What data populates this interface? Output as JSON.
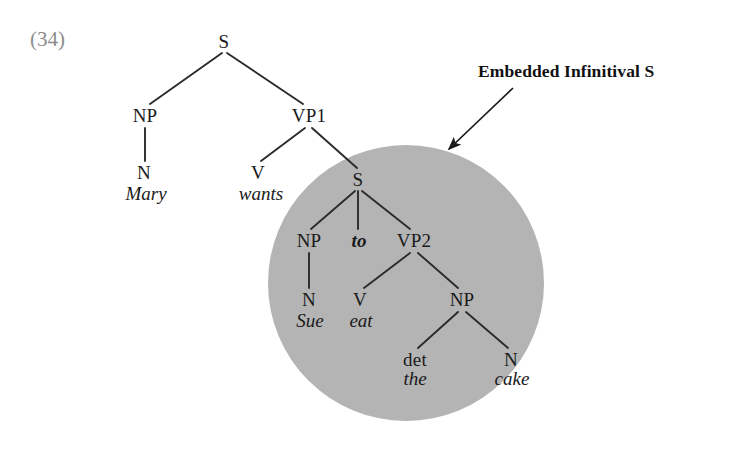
{
  "example": {
    "number_label": "(34)"
  },
  "annotation": {
    "callout_text": "Embedded Infinitival S",
    "arrow_name": "callout-arrow",
    "highlight_shape": "circle",
    "highlight_color": "#b4b4b4"
  },
  "colors": {
    "background": "#ffffff",
    "ink": "#1a1a1a",
    "example_number": "#8c8c8c",
    "highlight_gray": "#b4b4b4",
    "edge_line": "#2b2b2b"
  },
  "tree": {
    "nodes": [
      {
        "id": "S0",
        "label": "S",
        "x": 224,
        "y": 41,
        "kind": "category"
      },
      {
        "id": "NP1",
        "label": "NP",
        "x": 145,
        "y": 115,
        "kind": "category"
      },
      {
        "id": "VP1",
        "label": "VP1",
        "x": 309,
        "y": 115,
        "kind": "category"
      },
      {
        "id": "N1",
        "label": "N",
        "x": 144,
        "y": 172,
        "kind": "category"
      },
      {
        "id": "V1",
        "label": "V",
        "x": 258,
        "y": 172,
        "kind": "category"
      },
      {
        "id": "S1",
        "label": "S",
        "x": 358,
        "y": 179,
        "kind": "category"
      },
      {
        "id": "NP2",
        "label": "NP",
        "x": 309,
        "y": 240,
        "kind": "category"
      },
      {
        "id": "VP2",
        "label": "VP2",
        "x": 414,
        "y": 240,
        "kind": "category"
      },
      {
        "id": "N2",
        "label": "N",
        "x": 309,
        "y": 299,
        "kind": "category"
      },
      {
        "id": "V2",
        "label": "V",
        "x": 360,
        "y": 299,
        "kind": "category"
      },
      {
        "id": "NP3",
        "label": "NP",
        "x": 462,
        "y": 299,
        "kind": "category"
      },
      {
        "id": "DET1",
        "label": "det",
        "x": 415,
        "y": 359,
        "kind": "category"
      },
      {
        "id": "N3",
        "label": "N",
        "x": 511,
        "y": 359,
        "kind": "category"
      }
    ],
    "terminals": [
      {
        "id": "w-mary",
        "label": "Mary",
        "x": 146,
        "y": 193,
        "style": "italic"
      },
      {
        "id": "w-wants",
        "label": "wants",
        "x": 261,
        "y": 193,
        "style": "italic"
      },
      {
        "id": "w-to",
        "label": "to",
        "x": 359,
        "y": 240,
        "style": "bold-italic"
      },
      {
        "id": "w-sue",
        "label": "Sue",
        "x": 310,
        "y": 320,
        "style": "italic"
      },
      {
        "id": "w-eat",
        "label": "eat",
        "x": 361,
        "y": 320,
        "style": "italic"
      },
      {
        "id": "w-the",
        "label": "the",
        "x": 415,
        "y": 378,
        "style": "italic"
      },
      {
        "id": "w-cake",
        "label": "cake",
        "x": 512,
        "y": 378,
        "style": "italic"
      }
    ],
    "edges": [
      {
        "from": "S0",
        "to": "NP1",
        "x1": 222,
        "y1": 53,
        "x2": 150,
        "y2": 104
      },
      {
        "from": "S0",
        "to": "VP1",
        "x1": 227,
        "y1": 53,
        "x2": 303,
        "y2": 104
      },
      {
        "from": "NP1",
        "to": "N1",
        "x1": 145,
        "y1": 128,
        "x2": 145,
        "y2": 161
      },
      {
        "from": "VP1",
        "to": "V1",
        "x1": 305,
        "y1": 128,
        "x2": 261,
        "y2": 161
      },
      {
        "from": "VP1",
        "to": "S1",
        "x1": 312,
        "y1": 128,
        "x2": 357,
        "y2": 168
      },
      {
        "from": "S1",
        "to": "NP2",
        "x1": 355,
        "y1": 191,
        "x2": 311,
        "y2": 229
      },
      {
        "from": "S1",
        "to": "to",
        "x1": 358,
        "y1": 191,
        "x2": 358,
        "y2": 229
      },
      {
        "from": "S1",
        "to": "VP2",
        "x1": 362,
        "y1": 191,
        "x2": 410,
        "y2": 229
      },
      {
        "from": "NP2",
        "to": "N2",
        "x1": 309,
        "y1": 253,
        "x2": 309,
        "y2": 288
      },
      {
        "from": "VP2",
        "to": "V2",
        "x1": 410,
        "y1": 253,
        "x2": 364,
        "y2": 288
      },
      {
        "from": "VP2",
        "to": "NP3",
        "x1": 418,
        "y1": 253,
        "x2": 458,
        "y2": 288
      },
      {
        "from": "NP3",
        "to": "DET1",
        "x1": 458,
        "y1": 312,
        "x2": 418,
        "y2": 348
      },
      {
        "from": "NP3",
        "to": "N3",
        "x1": 466,
        "y1": 312,
        "x2": 508,
        "y2": 348
      }
    ]
  },
  "arrow": {
    "x1": 513,
    "y1": 88,
    "x2": 449,
    "y2": 149
  },
  "circle": {
    "cx": 406,
    "cy": 283,
    "r": 138
  }
}
